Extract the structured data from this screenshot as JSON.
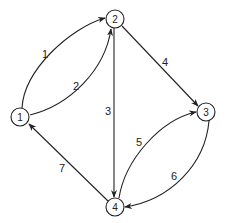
{
  "diagram": {
    "type": "directed-graph",
    "nodes": [
      {
        "id": "1",
        "label": "1"
      },
      {
        "id": "2",
        "label": "2"
      },
      {
        "id": "3",
        "label": "3"
      },
      {
        "id": "4",
        "label": "4"
      }
    ],
    "edges": [
      {
        "label": "1",
        "from": "1",
        "to": "2"
      },
      {
        "label": "2",
        "from": "1",
        "to": "2"
      },
      {
        "label": "3",
        "from": "2",
        "to": "4"
      },
      {
        "label": "4",
        "from": "2",
        "to": "3"
      },
      {
        "label": "5",
        "from": "4",
        "to": "3"
      },
      {
        "label": "6",
        "from": "3",
        "to": "4"
      },
      {
        "label": "7",
        "from": "4",
        "to": "1"
      }
    ]
  }
}
